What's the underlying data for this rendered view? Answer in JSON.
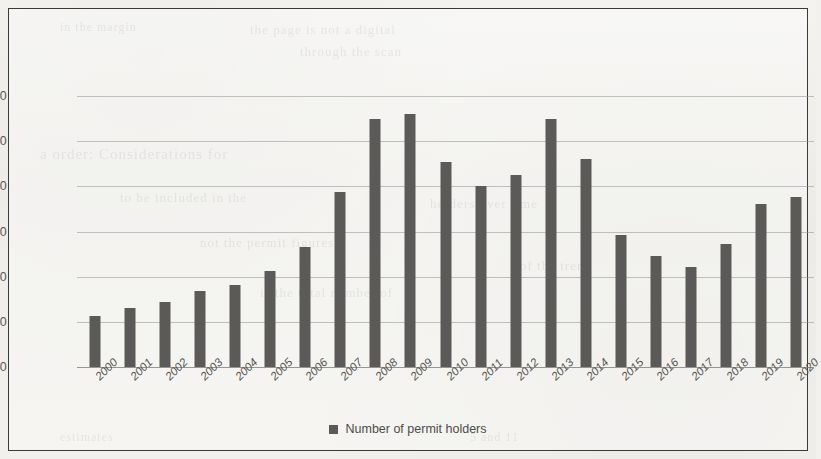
{
  "page": {
    "bleed_through": [
      {
        "text": "the page is not a digital",
        "x": 250,
        "y": 22,
        "size": 13
      },
      {
        "text": "through the scan",
        "x": 300,
        "y": 44,
        "size": 13
      },
      {
        "text": "in the margin",
        "x": 60,
        "y": 20,
        "size": 12
      },
      {
        "text": "a order: Considerations for",
        "x": 40,
        "y": 146,
        "size": 15
      },
      {
        "text": "to be included in the",
        "x": 120,
        "y": 190,
        "size": 13
      },
      {
        "text": "not the permit figures",
        "x": 200,
        "y": 235,
        "size": 13
      },
      {
        "text": "is the total number of",
        "x": 260,
        "y": 285,
        "size": 13
      },
      {
        "text": "holders over time",
        "x": 430,
        "y": 196,
        "size": 13
      },
      {
        "text": "of the trend",
        "x": 520,
        "y": 258,
        "size": 13
      },
      {
        "text": "5 and 11",
        "x": 470,
        "y": 430,
        "size": 12
      },
      {
        "text": "estimates",
        "x": 60,
        "y": 430,
        "size": 12
      }
    ]
  },
  "chart_data": {
    "type": "bar",
    "title": "",
    "xlabel": "",
    "ylabel": "",
    "ylim": [
      0,
      120000
    ],
    "ytick_step": 20000,
    "ytick_labels": [
      "120000",
      "100000",
      "80000",
      "60000",
      "40000",
      "20000",
      "0"
    ],
    "ytick_values": [
      120000,
      100000,
      80000,
      60000,
      40000,
      20000,
      0
    ],
    "grid": true,
    "legend_position": "bottom-center",
    "legend": [
      "Number of permit holders"
    ],
    "series_color": "#5b5a58",
    "categories": [
      "2000",
      "2001",
      "2002",
      "2003",
      "2004",
      "2005",
      "2006",
      "2007",
      "2008",
      "2009",
      "2010",
      "2011",
      "2012",
      "2013",
      "2014",
      "2015",
      "2016",
      "2017",
      "2018",
      "2019",
      "2020"
    ],
    "series": [
      {
        "name": "Number of permit holders",
        "values": [
          22500,
          26000,
          29000,
          33500,
          36500,
          42500,
          53000,
          77500,
          110000,
          112000,
          91000,
          80000,
          85000,
          110000,
          92000,
          58500,
          49000,
          44500,
          54500,
          72000,
          75500
        ]
      }
    ]
  }
}
